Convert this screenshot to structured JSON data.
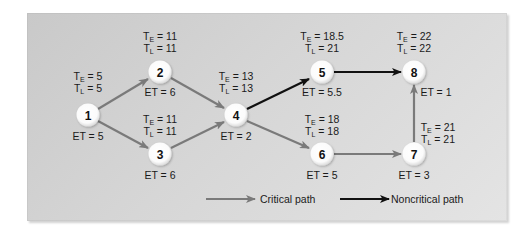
{
  "diagram": {
    "type": "pert-network",
    "colors": {
      "critical": "#7a7a7a",
      "noncritical": "#111111",
      "node_fill": "#ffffff",
      "panel_bg": "#d4d4d4"
    },
    "nodes": [
      {
        "id": "1",
        "label": "1",
        "te": "5",
        "tl": "5",
        "et": "5"
      },
      {
        "id": "2",
        "label": "2",
        "te": "11",
        "tl": "11",
        "et": "6"
      },
      {
        "id": "3",
        "label": "3",
        "te": "11",
        "tl": "11",
        "et": "6"
      },
      {
        "id": "4",
        "label": "4",
        "te": "13",
        "tl": "13",
        "et": "2"
      },
      {
        "id": "5",
        "label": "5",
        "te": "18.5",
        "tl": "21",
        "et": "5.5"
      },
      {
        "id": "6",
        "label": "6",
        "te": "18",
        "tl": "18",
        "et": "5"
      },
      {
        "id": "7",
        "label": "7",
        "te": "21",
        "tl": "21",
        "et": "3"
      },
      {
        "id": "8",
        "label": "8",
        "te": "22",
        "tl": "22",
        "et": "1"
      }
    ],
    "edges": [
      {
        "from": "1",
        "to": "2",
        "type": "critical"
      },
      {
        "from": "1",
        "to": "3",
        "type": "critical"
      },
      {
        "from": "2",
        "to": "4",
        "type": "critical"
      },
      {
        "from": "3",
        "to": "4",
        "type": "critical"
      },
      {
        "from": "4",
        "to": "5",
        "type": "noncritical"
      },
      {
        "from": "4",
        "to": "6",
        "type": "critical"
      },
      {
        "from": "5",
        "to": "8",
        "type": "noncritical"
      },
      {
        "from": "6",
        "to": "7",
        "type": "critical"
      },
      {
        "from": "7",
        "to": "8",
        "type": "critical"
      }
    ],
    "labels": {
      "te_prefix": "T",
      "te_sub": "E",
      "tl_prefix": "T",
      "tl_sub": "L",
      "eq": " = ",
      "et_prefix": "ET = "
    }
  },
  "legend": {
    "critical_label": "Critical path",
    "noncritical_label": "Noncritical path"
  }
}
